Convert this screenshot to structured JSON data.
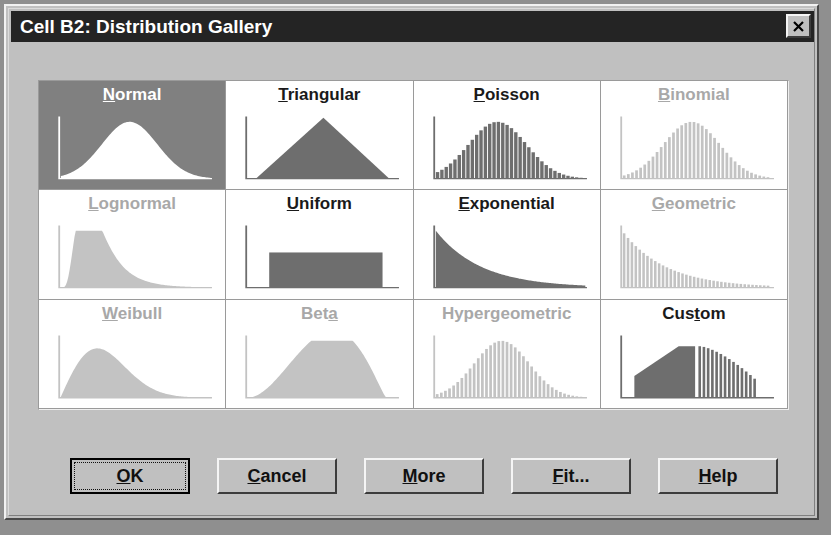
{
  "window": {
    "title": "Cell B2: Distribution Gallery",
    "close_label": "close-icon",
    "accent_titlebar": "#242424",
    "face_color": "#c0c0c0",
    "selected_color": "#808080",
    "enabled_plot_color": "#6e6e6e",
    "disabled_plot_color": "#c3c3c3"
  },
  "gallery": {
    "columns": 4,
    "rows": 3,
    "cells": [
      {
        "name": "Normal",
        "accel": "N",
        "accel_index": 0,
        "state": "selected",
        "shape": "normal"
      },
      {
        "name": "Triangular",
        "accel": "T",
        "accel_index": 0,
        "state": "enabled",
        "shape": "triangular"
      },
      {
        "name": "Poisson",
        "accel": "P",
        "accel_index": 0,
        "state": "enabled",
        "shape": "poisson"
      },
      {
        "name": "Binomial",
        "accel": "B",
        "accel_index": 0,
        "state": "disabled",
        "shape": "binomial"
      },
      {
        "name": "Lognormal",
        "accel": "L",
        "accel_index": 0,
        "state": "disabled",
        "shape": "lognormal"
      },
      {
        "name": "Uniform",
        "accel": "U",
        "accel_index": 0,
        "state": "enabled",
        "shape": "uniform"
      },
      {
        "name": "Exponential",
        "accel": "E",
        "accel_index": 0,
        "state": "enabled",
        "shape": "exponential"
      },
      {
        "name": "Geometric",
        "accel": "G",
        "accel_index": 0,
        "state": "disabled",
        "shape": "geometric"
      },
      {
        "name": "Weibull",
        "accel": "W",
        "accel_index": 0,
        "state": "disabled",
        "shape": "weibull"
      },
      {
        "name": "Beta",
        "accel": "a",
        "accel_index": 3,
        "state": "disabled",
        "shape": "beta"
      },
      {
        "name": "Hypergeometric",
        "accel": "g",
        "accel_index": 5,
        "state": "disabled",
        "shape": "hypergeometric"
      },
      {
        "name": "Custom",
        "accel": "s",
        "accel_index": 3,
        "state": "enabled",
        "shape": "custom"
      }
    ]
  },
  "buttons": [
    {
      "label": "OK",
      "accel": "O",
      "accel_index": 0,
      "default": true,
      "x": 64,
      "width": 120
    },
    {
      "label": "Cancel",
      "accel": "C",
      "accel_index": 0,
      "default": false,
      "x": 211,
      "width": 120
    },
    {
      "label": "More",
      "accel": "M",
      "accel_index": 0,
      "default": false,
      "x": 358,
      "width": 120
    },
    {
      "label": "Fit...",
      "accel": "F",
      "accel_index": 0,
      "default": false,
      "x": 505,
      "width": 120
    },
    {
      "label": "Help",
      "accel": "H",
      "accel_index": 0,
      "default": false,
      "x": 652,
      "width": 120
    }
  ]
}
